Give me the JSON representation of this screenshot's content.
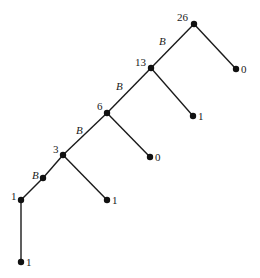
{
  "diagram": {
    "type": "binary-tree",
    "nodes": [
      {
        "id": "n26",
        "label": "26",
        "x": 194,
        "y": 24
      },
      {
        "id": "n13",
        "label": "13",
        "x": 151,
        "y": 68
      },
      {
        "id": "n6",
        "label": "6",
        "x": 107,
        "y": 113
      },
      {
        "id": "n3",
        "label": "3",
        "x": 63,
        "y": 155
      },
      {
        "id": "nB",
        "label": "",
        "x": 43,
        "y": 178
      },
      {
        "id": "n1",
        "label": "1",
        "x": 21,
        "y": 200
      },
      {
        "id": "l0a",
        "label": "0",
        "x": 236,
        "y": 69
      },
      {
        "id": "l1a",
        "label": "1",
        "x": 193,
        "y": 116
      },
      {
        "id": "l0b",
        "label": "0",
        "x": 150,
        "y": 157
      },
      {
        "id": "l1b",
        "label": "1",
        "x": 107,
        "y": 200
      },
      {
        "id": "l1c",
        "label": "1",
        "x": 21,
        "y": 262
      }
    ],
    "edges": [
      {
        "from": "n26",
        "to": "n13",
        "label": "B"
      },
      {
        "from": "n26",
        "to": "l0a",
        "label": ""
      },
      {
        "from": "n13",
        "to": "n6",
        "label": "B"
      },
      {
        "from": "n13",
        "to": "l1a",
        "label": ""
      },
      {
        "from": "n6",
        "to": "n3",
        "label": "B"
      },
      {
        "from": "n6",
        "to": "l0b",
        "label": ""
      },
      {
        "from": "n3",
        "to": "nB",
        "label": ""
      },
      {
        "from": "nB",
        "to": "n1",
        "label": ""
      },
      {
        "from": "n3",
        "to": "l1b",
        "label": ""
      },
      {
        "from": "n1",
        "to": "l1c",
        "label": ""
      }
    ],
    "labels": {
      "n26": "26",
      "n13": "13",
      "n6": "6",
      "n3": "3",
      "n1": "1",
      "l0a": "0",
      "l1a": "1",
      "l0b": "0",
      "l1b": "1",
      "l1c": "1"
    },
    "edge_labels": {
      "e26_13": "B",
      "e13_6": "B",
      "e6_3": "B",
      "e3_1": "B"
    }
  }
}
